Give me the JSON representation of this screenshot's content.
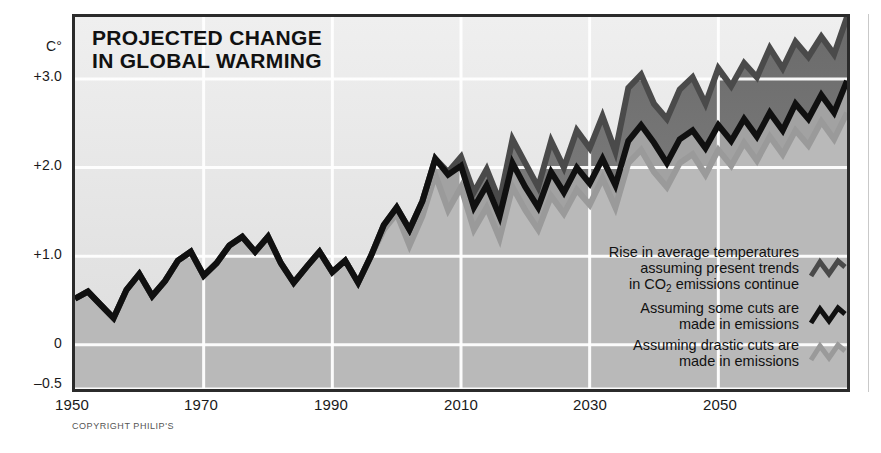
{
  "title": "PROJECTED CHANGE\nIN GLOBAL WARMING",
  "copyright": "COPYRIGHT PHILIP'S",
  "axis": {
    "y_unit": "C°",
    "y_ticks": [
      "+3.0",
      "+2.0",
      "+1.0",
      "0",
      "–0.5"
    ],
    "x_ticks": [
      "1950",
      "1970",
      "1990",
      "2010",
      "2030",
      "2050"
    ]
  },
  "legend": {
    "items": [
      {
        "label": "Rise in average temperatures\nassuming present trends\nin CO2 emissions continue",
        "label_pre": "Rise in average temperatures\nassuming present trends\nin CO",
        "label_post": " emissions continue",
        "sub": "2",
        "color": "#4a4a4a",
        "marker": "zigzag-icon"
      },
      {
        "label": "Assuming some cuts are\nmade in emissions",
        "color": "#101010",
        "marker": "zigzag-icon"
      },
      {
        "label": "Assuming drastic cuts are\nmade in emissions",
        "color": "#9a9a9a",
        "marker": "zigzag-icon"
      }
    ]
  },
  "colors": {
    "present_trends": "#4a4a4a",
    "some_cuts": "#101010",
    "drastic_cuts": "#9a9a9a",
    "frame": "#2b2b2b",
    "gridline": "#ffffff",
    "fill_upper": "#e9e9e9",
    "fill_band1": "#c8c8c8",
    "fill_band2": "#b4b4b4",
    "fill_band3": "#a0a0a0",
    "fill_dark": "#6f6f6f"
  },
  "chart_data": {
    "type": "line",
    "title": "PROJECTED CHANGE IN GLOBAL WARMING",
    "xlabel": "",
    "ylabel": "C°",
    "xlim": [
      1950,
      2070
    ],
    "ylim": [
      -0.5,
      3.7
    ],
    "grid": true,
    "grid_x": [
      1970,
      1990,
      2010,
      2030,
      2050
    ],
    "grid_y": [
      -0.5,
      0,
      1.0,
      2.0,
      3.0
    ],
    "legend_position": "inside-bottom-right",
    "x": [
      1950,
      1952,
      1954,
      1956,
      1958,
      1960,
      1962,
      1964,
      1966,
      1968,
      1970,
      1972,
      1974,
      1976,
      1978,
      1980,
      1982,
      1984,
      1986,
      1988,
      1990,
      1992,
      1994,
      1996,
      1998,
      2000,
      2002,
      2004,
      2006,
      2008,
      2010,
      2012,
      2014,
      2016,
      2018,
      2020,
      2022,
      2024,
      2026,
      2028,
      2030,
      2032,
      2034,
      2036,
      2038,
      2040,
      2042,
      2044,
      2046,
      2048,
      2050,
      2052,
      2054,
      2056,
      2058,
      2060,
      2062,
      2064,
      2066,
      2068,
      2070
    ],
    "series": [
      {
        "name": "Rise in average temperatures assuming present trends in CO2 emissions continue",
        "color": "#4a4a4a",
        "values": [
          0.52,
          0.6,
          0.45,
          0.3,
          0.62,
          0.8,
          0.55,
          0.72,
          0.95,
          1.05,
          0.78,
          0.92,
          1.12,
          1.22,
          1.05,
          1.22,
          0.92,
          0.7,
          0.88,
          1.05,
          0.82,
          0.95,
          0.7,
          1.0,
          1.35,
          1.55,
          1.3,
          1.62,
          2.1,
          1.95,
          2.12,
          1.72,
          1.98,
          1.62,
          2.32,
          2.05,
          1.78,
          2.3,
          2.0,
          2.42,
          2.22,
          2.58,
          2.18,
          2.9,
          3.05,
          2.72,
          2.55,
          2.88,
          3.02,
          2.72,
          3.12,
          2.92,
          3.18,
          3.02,
          3.35,
          3.12,
          3.42,
          3.25,
          3.48,
          3.28,
          3.7
        ]
      },
      {
        "name": "Assuming some cuts are made in emissions",
        "color": "#101010",
        "values": [
          0.52,
          0.6,
          0.45,
          0.3,
          0.62,
          0.8,
          0.55,
          0.72,
          0.95,
          1.05,
          0.78,
          0.92,
          1.12,
          1.22,
          1.05,
          1.22,
          0.92,
          0.7,
          0.88,
          1.05,
          0.82,
          0.95,
          0.7,
          1.0,
          1.35,
          1.55,
          1.3,
          1.62,
          2.1,
          1.92,
          2.02,
          1.55,
          1.8,
          1.45,
          2.05,
          1.78,
          1.55,
          1.95,
          1.72,
          2.0,
          1.82,
          2.1,
          1.8,
          2.3,
          2.48,
          2.28,
          2.05,
          2.32,
          2.42,
          2.22,
          2.48,
          2.3,
          2.55,
          2.35,
          2.62,
          2.42,
          2.72,
          2.55,
          2.82,
          2.62,
          2.98
        ]
      },
      {
        "name": "Assuming drastic cuts are made in emissions",
        "color": "#9a9a9a",
        "values": [
          0.52,
          0.6,
          0.45,
          0.3,
          0.62,
          0.8,
          0.55,
          0.72,
          0.95,
          1.05,
          0.78,
          0.92,
          1.12,
          1.22,
          1.05,
          1.22,
          0.92,
          0.7,
          0.88,
          1.05,
          0.82,
          0.95,
          0.7,
          1.0,
          1.3,
          1.48,
          1.12,
          1.45,
          1.92,
          1.52,
          1.78,
          1.3,
          1.55,
          1.2,
          1.78,
          1.52,
          1.3,
          1.68,
          1.48,
          1.75,
          1.58,
          1.88,
          1.55,
          2.05,
          2.2,
          1.95,
          1.78,
          2.05,
          2.15,
          1.92,
          2.2,
          2.02,
          2.28,
          2.08,
          2.35,
          2.15,
          2.42,
          2.25,
          2.52,
          2.32,
          2.62
        ]
      }
    ]
  }
}
